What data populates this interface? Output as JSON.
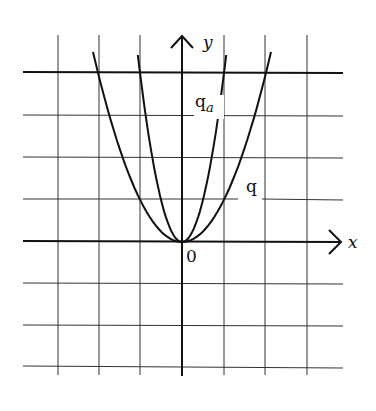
{
  "figure": {
    "type": "function-graph",
    "axes": {
      "x_label": "x",
      "y_label": "y",
      "origin_label": "0"
    },
    "grid": {
      "unit_px": 41.7,
      "x_range": [
        -4,
        4
      ],
      "y_range": [
        -3,
        4
      ],
      "highlighted_line": "y = 4"
    },
    "curves": [
      {
        "name": "q",
        "label": "q",
        "label_sub": "",
        "formula": "y = x^2",
        "coef": 1
      },
      {
        "name": "q_a",
        "label": "q",
        "label_sub": "a",
        "formula": "y = a x^2 (a ≈ 4)",
        "coef": 4
      }
    ]
  },
  "labels": {
    "x": "x",
    "y": "y",
    "origin": "0",
    "q": "q",
    "qa_main": "q",
    "qa_sub": "a"
  },
  "colors": {
    "ink": "#111111",
    "background": "#ffffff"
  }
}
